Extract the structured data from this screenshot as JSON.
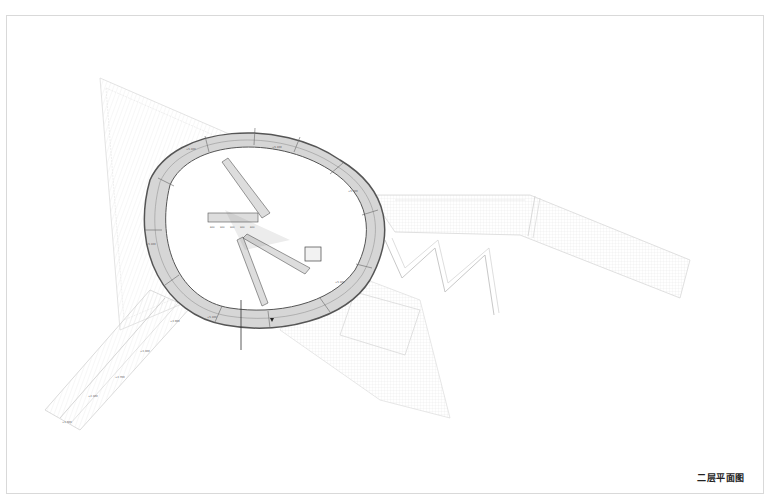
{
  "drawing": {
    "title": "二层平面图",
    "type": "architectural floor plan",
    "colors": {
      "frame_border": "#d9d9d9",
      "ring_fill": "#d6d6d6",
      "ring_edge": "#555555",
      "hatch_lines": "#c8c8c8",
      "ghost_lines": "#e0e0e0",
      "title_text": "#222222"
    },
    "elevation_labels": [
      "+5.100",
      "+5.100",
      "+5.100",
      "+5.100",
      "+5.100",
      "+5.100",
      "+3.900",
      "+3.300",
      "+2.700",
      "+2.100",
      "+1.500"
    ],
    "stair_dimension_labels": [
      "600",
      "900",
      "900",
      "900",
      "600"
    ]
  }
}
